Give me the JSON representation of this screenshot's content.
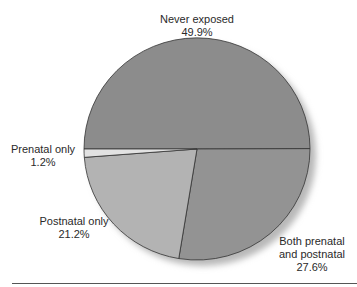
{
  "chart_data": {
    "type": "pie",
    "title": "",
    "slices": [
      {
        "label": "Never exposed",
        "value": 49.9,
        "display": "49.9%",
        "color": "#8c8c8c"
      },
      {
        "label": "Both prenatal and postnatal",
        "value": 27.6,
        "display": "27.6%",
        "color": "#939393"
      },
      {
        "label": "Postnatal only",
        "value": 21.2,
        "display": "21.2%",
        "color": "#b3b3b3"
      },
      {
        "label": "Prenatal only",
        "value": 1.2,
        "display": "1.2%",
        "color": "#e2e2e2"
      }
    ],
    "legend": "none (direct labels)"
  },
  "labels": {
    "never": {
      "line1": "Never exposed",
      "line2": "49.9%"
    },
    "both": {
      "line1": "Both prenatal",
      "line2": "and postnatal",
      "line3": "27.6%"
    },
    "postnatal": {
      "line1": "Postnatal only",
      "line2": "21.2%"
    },
    "prenatal": {
      "line1": "Prenatal only",
      "line2": "1.2%"
    }
  }
}
